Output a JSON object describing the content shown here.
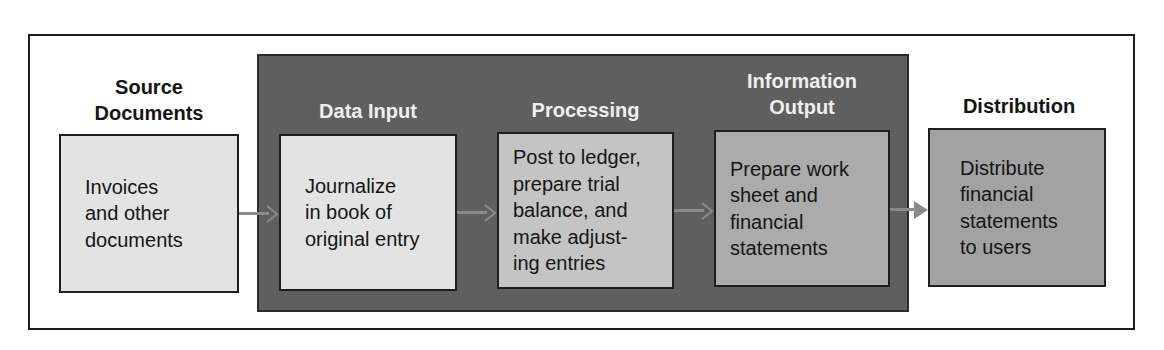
{
  "diagram": {
    "stages": [
      {
        "id": "source",
        "heading": "Source Documents",
        "heading_lines": [
          "Source",
          "Documents"
        ],
        "text_lines": [
          "Invoices",
          "and other",
          "documents"
        ],
        "fill": "#e3e3e3"
      },
      {
        "id": "data-input",
        "heading": "Data Input",
        "heading_lines": [
          "Data Input"
        ],
        "text_lines": [
          "Journalize",
          "in book of",
          "original entry"
        ],
        "fill": "#e3e3e3"
      },
      {
        "id": "processing",
        "heading": "Processing",
        "heading_lines": [
          "Processing"
        ],
        "text_lines": [
          "Post to ledger,",
          "prepare trial",
          "balance, and",
          "make adjust-",
          "ing entries"
        ],
        "fill": "#c4c4c4"
      },
      {
        "id": "information-output",
        "heading": "Information Output",
        "heading_lines": [
          "Information",
          "Output"
        ],
        "text_lines": [
          "Prepare work",
          "sheet and",
          "financial",
          "statements"
        ],
        "fill": "#ababab"
      },
      {
        "id": "distribution",
        "heading": "Distribution",
        "heading_lines": [
          "Distribution"
        ],
        "text_lines": [
          "Distribute",
          "financial",
          "statements",
          "to users"
        ],
        "fill": "#a2a2a2"
      }
    ],
    "connections": [
      {
        "from": "source",
        "to": "data-input"
      },
      {
        "from": "data-input",
        "to": "processing"
      },
      {
        "from": "processing",
        "to": "information-output"
      },
      {
        "from": "information-output",
        "to": "distribution"
      }
    ],
    "colors": {
      "frame_border": "#1c1c1c",
      "dark_panel": "#5f5f5f",
      "arrow": "#8a8a8a",
      "heading_on_dark": "#efefef",
      "heading_on_light": "#141414"
    }
  }
}
